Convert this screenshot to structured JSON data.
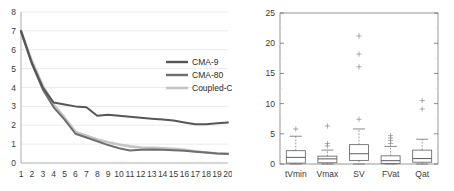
{
  "figure": {
    "panels": [
      "line-chart",
      "box-plot"
    ]
  },
  "chart_data": [
    {
      "type": "line",
      "title": "",
      "xlabel": "",
      "ylabel": "",
      "xlim": [
        1,
        20
      ],
      "ylim": [
        0,
        8
      ],
      "grid": true,
      "legend_position": "upper-right",
      "x": [
        1,
        2,
        3,
        4,
        5,
        6,
        7,
        8,
        9,
        10,
        11,
        12,
        13,
        14,
        15,
        16,
        17,
        18,
        19,
        20
      ],
      "xticks": [
        "1",
        "2",
        "3",
        "4",
        "5",
        "6",
        "7",
        "8",
        "9",
        "10",
        "11",
        "12",
        "13",
        "14",
        "15",
        "16",
        "17",
        "18",
        "19",
        "20"
      ],
      "yticks": [
        "0",
        "1",
        "2",
        "3",
        "4",
        "5",
        "6",
        "7",
        "8"
      ],
      "series": [
        {
          "name": "CMA-9",
          "color": "#565656",
          "values": [
            7.0,
            5.3,
            4.0,
            3.2,
            3.1,
            3.0,
            2.95,
            2.5,
            2.55,
            2.5,
            2.45,
            2.4,
            2.35,
            2.3,
            2.25,
            2.15,
            2.05,
            2.05,
            2.1,
            2.15
          ]
        },
        {
          "name": "CMA-80",
          "color": "#6e6e6e",
          "values": [
            6.95,
            5.25,
            3.9,
            2.95,
            2.3,
            1.55,
            1.35,
            1.15,
            0.95,
            0.78,
            0.66,
            0.7,
            0.72,
            0.7,
            0.68,
            0.65,
            0.6,
            0.55,
            0.5,
            0.48
          ]
        },
        {
          "name": "Coupled-CMA",
          "color": "#c4c4c4",
          "values": [
            7.0,
            5.4,
            4.1,
            3.1,
            2.4,
            1.65,
            1.45,
            1.25,
            1.1,
            0.98,
            0.88,
            0.82,
            0.8,
            0.78,
            0.75,
            0.7,
            0.62,
            0.56,
            0.52,
            0.5
          ]
        }
      ],
      "legend": [
        {
          "label": "CMA-9",
          "color": "#565656"
        },
        {
          "label": "CMA-80",
          "color": "#6e6e6e"
        },
        {
          "label": "Coupled-CMA",
          "color": "#c4c4c4"
        }
      ]
    },
    {
      "type": "box",
      "title": "",
      "xlabel": "",
      "ylabel": "",
      "ylim": [
        0,
        25
      ],
      "yticks": [
        "0",
        "5",
        "10",
        "15",
        "20",
        "25"
      ],
      "categories": [
        "tVmin",
        "Vmax",
        "SV",
        "FVat",
        "Qat"
      ],
      "boxes": [
        {
          "category": "tVmin",
          "whisker_low": 0.0,
          "q1": 0.15,
          "median": 1.1,
          "q3": 2.2,
          "whisker_high": 4.6,
          "outliers": [
            5.8
          ]
        },
        {
          "category": "Vmax",
          "whisker_low": 0.0,
          "q1": 0.2,
          "median": 0.85,
          "q3": 1.3,
          "whisker_high": 2.3,
          "outliers": [
            3.0,
            3.4,
            6.3
          ]
        },
        {
          "category": "SV",
          "whisker_low": 0.0,
          "q1": 0.6,
          "median": 1.7,
          "q3": 3.2,
          "whisker_high": 5.8,
          "outliers": [
            7.4,
            16.1,
            18.2,
            21.2
          ]
        },
        {
          "category": "FVat",
          "whisker_low": 0.0,
          "q1": 0.1,
          "median": 0.55,
          "q3": 1.35,
          "whisker_high": 2.9,
          "outliers": [
            3.4,
            3.9,
            4.3,
            4.7
          ]
        },
        {
          "category": "Qat",
          "whisker_low": 0.0,
          "q1": 0.3,
          "median": 0.9,
          "q3": 2.3,
          "whisker_high": 4.1,
          "outliers": [
            9.1,
            10.5
          ]
        }
      ]
    }
  ]
}
